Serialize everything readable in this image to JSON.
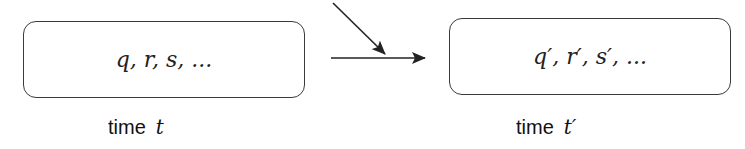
{
  "diagram": {
    "left_state": {
      "contents": "q, r, s, ...",
      "label_word": "time",
      "label_var": "t"
    },
    "right_state": {
      "contents": "q′, r′, s′, ...",
      "label_word": "time",
      "label_var": "t′"
    },
    "arrows": [
      {
        "name": "transition-arrow",
        "from": "left_state",
        "to": "right_state",
        "direction": "horizontal"
      },
      {
        "name": "external-input-arrow",
        "direction": "diagonal-down-right",
        "target": "transition-arrow"
      }
    ],
    "colors": {
      "stroke": "#3a3a3a",
      "text": "#222222",
      "background": "#ffffff"
    }
  }
}
